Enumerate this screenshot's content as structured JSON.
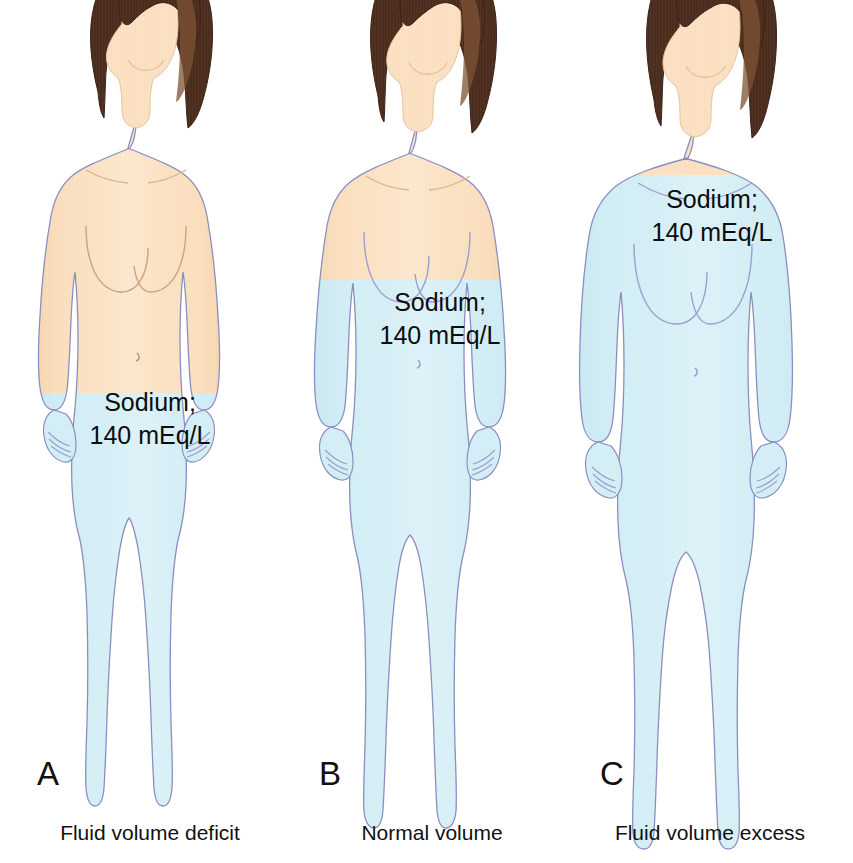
{
  "figure": {
    "background_color": "#ffffff",
    "palette": {
      "skin": "#fbe2c4",
      "skin_shadow": "#f5d2a8",
      "skin_highlight": "#fdeedc",
      "fluid": "#d4eef5",
      "fluid_edge": "#c3e6ef",
      "outline": "#8b8fc0",
      "hair_dark": "#4a2d1e",
      "hair_mid": "#6b4227",
      "hair_light": "#7d5334",
      "text": "#111111"
    }
  },
  "panels": [
    {
      "id": "panel-a",
      "letter": "A",
      "caption": "Fluid volume deficit",
      "sodium_line1": "Sodium;",
      "sodium_line2": "140 mEq/L",
      "fill_level_label": "hips",
      "center_x": 150,
      "label_x": 150,
      "label_y1": 411,
      "label_y2": 444,
      "letter_x": 48,
      "letter_y": 785,
      "caption_x": 150,
      "caption_y": 840,
      "waterline_y": 393,
      "body_scale": 0.92
    },
    {
      "id": "panel-b",
      "letter": "B",
      "caption": "Normal volume",
      "sodium_line1": "Sodium;",
      "sodium_line2": "140 mEq/L",
      "fill_level_label": "mid-chest",
      "center_x": 432,
      "label_x": 440,
      "label_y1": 311,
      "label_y2": 344,
      "letter_x": 330,
      "letter_y": 785,
      "caption_x": 432,
      "caption_y": 840,
      "waterline_y": 280,
      "body_scale": 1.0
    },
    {
      "id": "panel-c",
      "letter": "C",
      "caption": "Fluid volume excess",
      "sodium_line1": "Sodium;",
      "sodium_line2": "140 mEq/L",
      "fill_level_label": "shoulders",
      "center_x": 710,
      "label_x": 712,
      "label_y1": 208,
      "label_y2": 241,
      "letter_x": 612,
      "letter_y": 785,
      "caption_x": 710,
      "caption_y": 840,
      "waterline_y": 175,
      "body_scale": 1.14
    }
  ]
}
